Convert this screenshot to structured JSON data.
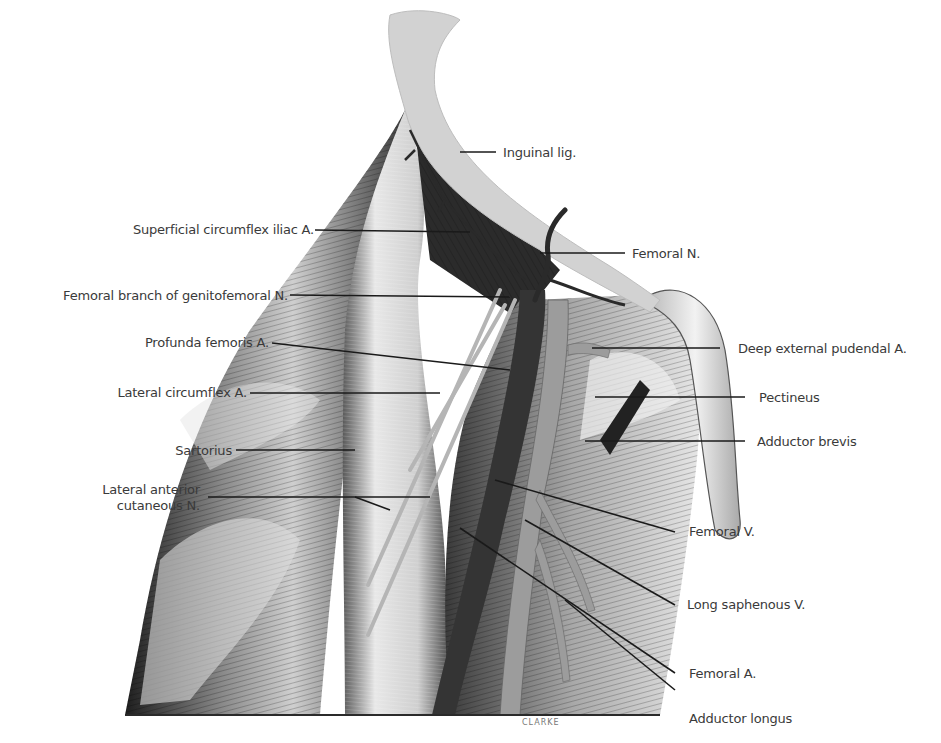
{
  "figure": {
    "signature": "CLARKE",
    "colors": {
      "background": "#ffffff",
      "label_text": "#3a3a3a",
      "leader_line": "#1a1a1a",
      "muscle_dark": "#2a2a2a",
      "muscle_mid": "#6b6b6b",
      "muscle_light": "#d9d9d9",
      "ligament": "#cfcfcf",
      "vessel_artery": "#9a9a9a",
      "vessel_vein": "#3c3c3c"
    }
  },
  "labels": {
    "left": [
      {
        "id": "superficial-circumflex-iliac-a",
        "text": "Superficial circumflex iliac A."
      },
      {
        "id": "femoral-branch-genitofemoral-n",
        "text": "Femoral branch of genitofemoral N."
      },
      {
        "id": "profunda-femoris-a",
        "text": "Profunda femoris A."
      },
      {
        "id": "lateral-circumflex-a",
        "text": "Lateral circumflex A."
      },
      {
        "id": "sartorius",
        "text": "Sartorius"
      },
      {
        "id": "lateral-anterior-cutaneous-n-1",
        "text": "Lateral anterior"
      },
      {
        "id": "lateral-anterior-cutaneous-n-2",
        "text": "cutaneous N."
      }
    ],
    "right": [
      {
        "id": "inguinal-lig",
        "text": "Inguinal lig."
      },
      {
        "id": "femoral-n",
        "text": "Femoral N."
      },
      {
        "id": "deep-external-pudendal-a",
        "text": "Deep external pudendal A."
      },
      {
        "id": "pectineus",
        "text": "Pectineus"
      },
      {
        "id": "adductor-brevis",
        "text": "Adductor brevis"
      },
      {
        "id": "femoral-v",
        "text": "Femoral V."
      },
      {
        "id": "long-saphenous-v",
        "text": "Long saphenous V."
      },
      {
        "id": "femoral-a",
        "text": "Femoral A."
      },
      {
        "id": "adductor-longus",
        "text": "Adductor longus"
      }
    ]
  }
}
